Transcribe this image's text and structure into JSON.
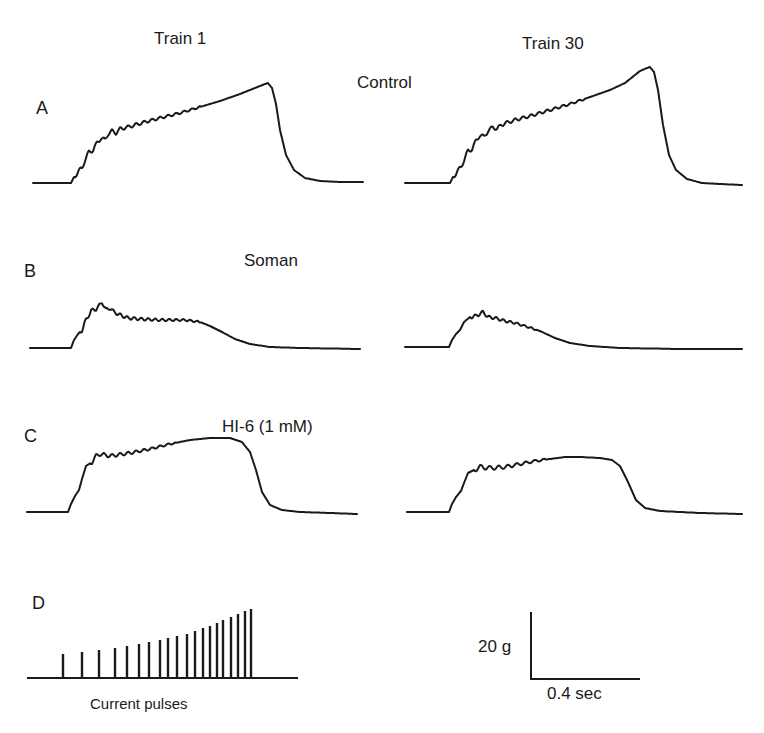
{
  "figure": {
    "column_titles": [
      "Train 1",
      "Train 30"
    ],
    "conditions": [
      {
        "letter": "A",
        "label": "Control"
      },
      {
        "letter": "B",
        "label": "Soman"
      },
      {
        "letter": "C",
        "label": "HI-6 (1 mM)"
      }
    ],
    "stimulus": {
      "letter": "D",
      "label": "Current pulses"
    },
    "scale_bar": {
      "force_label": "20 g",
      "time_label": "0.4 sec"
    }
  },
  "chart_data": {
    "type": "line",
    "title": "",
    "xlabel": "time",
    "ylabel": "tension",
    "scale": {
      "force": "20 g",
      "time": "0.4 sec"
    },
    "colors": {
      "trace": "#1a1a1a",
      "background": "#ffffff"
    },
    "panels": [
      {
        "id": "A",
        "condition": "Control",
        "train": "Train 1",
        "origin": [
          33,
          183
        ],
        "rise_start": 71,
        "peak": [
          268,
          83
        ],
        "end": [
          363,
          182
        ],
        "points": [
          [
            33,
            183
          ],
          [
            71,
            183
          ],
          [
            74,
            177
          ],
          [
            78,
            172
          ],
          [
            82,
            168
          ],
          [
            85,
            160
          ],
          [
            89,
            152
          ],
          [
            93,
            150
          ],
          [
            97,
            143
          ],
          [
            101,
            138
          ],
          [
            105,
            140
          ],
          [
            108,
            134
          ],
          [
            112,
            131
          ],
          [
            116,
            133
          ],
          [
            120,
            129
          ],
          [
            124,
            128
          ],
          [
            128,
            127
          ],
          [
            135,
            125
          ],
          [
            145,
            122
          ],
          [
            160,
            118
          ],
          [
            180,
            113
          ],
          [
            200,
            107
          ],
          [
            220,
            101
          ],
          [
            240,
            94
          ],
          [
            255,
            88
          ],
          [
            265,
            84
          ],
          [
            268,
            83
          ],
          [
            272,
            88
          ],
          [
            276,
            104
          ],
          [
            280,
            130
          ],
          [
            286,
            155
          ],
          [
            294,
            170
          ],
          [
            305,
            178
          ],
          [
            320,
            181
          ],
          [
            340,
            182
          ],
          [
            363,
            182
          ]
        ],
        "ripple": {
          "start": 74,
          "end": 200,
          "period": 8,
          "amp": 2.2
        }
      },
      {
        "id": "A",
        "condition": "Control",
        "train": "Train 30",
        "origin": [
          405,
          183
        ],
        "rise_start": 450,
        "peak": [
          650,
          67
        ],
        "end": [
          742,
          185
        ],
        "points": [
          [
            405,
            183
          ],
          [
            450,
            183
          ],
          [
            453,
            177
          ],
          [
            457,
            172
          ],
          [
            461,
            167
          ],
          [
            464,
            160
          ],
          [
            468,
            151
          ],
          [
            472,
            149
          ],
          [
            476,
            141
          ],
          [
            480,
            135
          ],
          [
            484,
            137
          ],
          [
            488,
            131
          ],
          [
            493,
            127
          ],
          [
            497,
            129
          ],
          [
            501,
            125
          ],
          [
            506,
            123
          ],
          [
            515,
            120
          ],
          [
            530,
            116
          ],
          [
            550,
            110
          ],
          [
            570,
            104
          ],
          [
            590,
            97
          ],
          [
            610,
            90
          ],
          [
            625,
            83
          ],
          [
            640,
            71
          ],
          [
            647,
            68
          ],
          [
            650,
            67
          ],
          [
            654,
            72
          ],
          [
            658,
            90
          ],
          [
            663,
            125
          ],
          [
            669,
            155
          ],
          [
            676,
            170
          ],
          [
            687,
            179
          ],
          [
            702,
            183
          ],
          [
            720,
            184
          ],
          [
            742,
            185
          ]
        ],
        "ripple": {
          "start": 453,
          "end": 585,
          "period": 8,
          "amp": 2.2
        }
      },
      {
        "id": "B",
        "condition": "Soman",
        "train": "Train 1",
        "origin": [
          30,
          348
        ],
        "rise_start": 71,
        "peak": [
          102,
          302
        ],
        "end": [
          360,
          349
        ],
        "points": [
          [
            30,
            348
          ],
          [
            71,
            348
          ],
          [
            74,
            340
          ],
          [
            78,
            334
          ],
          [
            82,
            330
          ],
          [
            86,
            320
          ],
          [
            91,
            311
          ],
          [
            96,
            309
          ],
          [
            100,
            305
          ],
          [
            102,
            302
          ],
          [
            106,
            310
          ],
          [
            110,
            308
          ],
          [
            114,
            312
          ],
          [
            120,
            315
          ],
          [
            128,
            318
          ],
          [
            140,
            319
          ],
          [
            160,
            320
          ],
          [
            185,
            320
          ],
          [
            200,
            322
          ],
          [
            210,
            326
          ],
          [
            222,
            332
          ],
          [
            235,
            339
          ],
          [
            250,
            344
          ],
          [
            270,
            347
          ],
          [
            300,
            348
          ],
          [
            360,
            349
          ]
        ],
        "ripple": {
          "start": 80,
          "end": 200,
          "period": 7,
          "amp": 2.0
        }
      },
      {
        "id": "B",
        "condition": "Soman",
        "train": "Train 30",
        "origin": [
          405,
          347
        ],
        "rise_start": 449,
        "peak": [
          483,
          312
        ],
        "end": [
          742,
          349
        ],
        "points": [
          [
            405,
            347
          ],
          [
            449,
            347
          ],
          [
            452,
            340
          ],
          [
            456,
            334
          ],
          [
            460,
            330
          ],
          [
            464,
            322
          ],
          [
            470,
            317
          ],
          [
            476,
            316
          ],
          [
            483,
            312
          ],
          [
            488,
            317
          ],
          [
            495,
            318
          ],
          [
            505,
            321
          ],
          [
            515,
            323
          ],
          [
            528,
            327
          ],
          [
            540,
            331
          ],
          [
            555,
            338
          ],
          [
            570,
            343
          ],
          [
            590,
            346
          ],
          [
            620,
            348
          ],
          [
            680,
            349
          ],
          [
            742,
            349
          ]
        ],
        "ripple": {
          "start": 470,
          "end": 535,
          "period": 7,
          "amp": 1.8
        }
      },
      {
        "id": "C",
        "condition": "HI-6 (1 mM)",
        "train": "Train 1",
        "origin": [
          27,
          512
        ],
        "rise_start": 68,
        "peak": [
          230,
          438
        ],
        "end": [
          357,
          514
        ],
        "points": [
          [
            27,
            512
          ],
          [
            68,
            512
          ],
          [
            71,
            504
          ],
          [
            75,
            496
          ],
          [
            79,
            490
          ],
          [
            82,
            479
          ],
          [
            86,
            466
          ],
          [
            92,
            462
          ],
          [
            96,
            456
          ],
          [
            100,
            454
          ],
          [
            110,
            456
          ],
          [
            130,
            453
          ],
          [
            150,
            449
          ],
          [
            170,
            444
          ],
          [
            190,
            440
          ],
          [
            210,
            438
          ],
          [
            230,
            438
          ],
          [
            242,
            442
          ],
          [
            250,
            452
          ],
          [
            256,
            470
          ],
          [
            262,
            492
          ],
          [
            270,
            505
          ],
          [
            282,
            510
          ],
          [
            300,
            512
          ],
          [
            330,
            513
          ],
          [
            357,
            514
          ]
        ],
        "ripple": {
          "start": 90,
          "end": 175,
          "period": 8,
          "amp": 2.0
        }
      },
      {
        "id": "C",
        "condition": "HI-6 (1 mM)",
        "train": "Train 30",
        "origin": [
          407,
          512
        ],
        "rise_start": 449,
        "peak": [
          580,
          457
        ],
        "end": [
          742,
          514
        ],
        "points": [
          [
            407,
            512
          ],
          [
            449,
            512
          ],
          [
            452,
            504
          ],
          [
            456,
            497
          ],
          [
            461,
            491
          ],
          [
            464,
            483
          ],
          [
            468,
            473
          ],
          [
            474,
            470
          ],
          [
            480,
            467
          ],
          [
            490,
            468
          ],
          [
            505,
            467
          ],
          [
            520,
            464
          ],
          [
            535,
            461
          ],
          [
            550,
            459
          ],
          [
            565,
            457
          ],
          [
            580,
            457
          ],
          [
            600,
            458
          ],
          [
            612,
            460
          ],
          [
            620,
            466
          ],
          [
            628,
            482
          ],
          [
            636,
            500
          ],
          [
            645,
            508
          ],
          [
            660,
            511
          ],
          [
            700,
            513
          ],
          [
            742,
            514
          ]
        ],
        "ripple": {
          "start": 474,
          "end": 545,
          "period": 9,
          "amp": 2.4
        }
      }
    ],
    "stimulus": {
      "label": "Current pulses",
      "baseline": {
        "x1": 27,
        "x2": 298,
        "y": 678
      },
      "pulse_count": 20,
      "pulse_x": [
        63,
        82,
        99,
        115,
        127,
        139,
        149,
        160,
        168,
        177,
        187,
        195,
        203,
        210,
        217,
        223,
        231,
        238,
        245,
        251
      ],
      "pulse_top_y": [
        654,
        652,
        650,
        648,
        646,
        644,
        642,
        640,
        638,
        636,
        634,
        631,
        628,
        626,
        623,
        620,
        617,
        614,
        611,
        609
      ]
    },
    "scale_bar_geometry": {
      "corner": [
        531,
        679
      ],
      "vertical_top": 612,
      "horizontal_end": 640
    }
  }
}
